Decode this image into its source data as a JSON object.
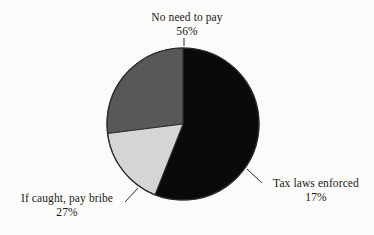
{
  "chart_data": {
    "type": "pie",
    "title": "",
    "labels": [
      "No need to pay",
      "Tax laws enforced",
      "If caught, pay bribe"
    ],
    "values": [
      56,
      17,
      27
    ],
    "value_labels": [
      "56%",
      "17%",
      "27%"
    ],
    "unit": "%",
    "total": 100,
    "start_angle_deg": 0,
    "direction": "clockwise",
    "legend": "none",
    "grid": false,
    "slices": [
      {
        "label": "No need to pay",
        "value": 56,
        "value_label": "56%",
        "color": "#0a0a0a",
        "start_deg": 0,
        "end_deg": 201.6,
        "leader": "vertical-tick-top"
      },
      {
        "label": "Tax laws enforced",
        "value": 17,
        "value_label": "17%",
        "color": "#d5d5d3",
        "start_deg": 201.6,
        "end_deg": 262.8,
        "leader": "diagonal-right"
      },
      {
        "label": "If caught, pay bribe",
        "value": 27,
        "value_label": "27%",
        "color": "#58585a",
        "start_deg": 262.8,
        "end_deg": 360,
        "leader": "diagonal-left"
      }
    ]
  },
  "figure": {
    "background_color": "#fbfbf9",
    "outline_color": "#2b2b2b",
    "text_color": "#1a1a18"
  },
  "labels": {
    "no_need_to_pay": {
      "text": "No need to pay",
      "value": "56%"
    },
    "tax_laws_enforced": {
      "text": "Tax laws enforced",
      "value": "17%"
    },
    "if_caught_pay_bribe": {
      "text": "If caught, pay bribe",
      "value": "27%"
    }
  }
}
